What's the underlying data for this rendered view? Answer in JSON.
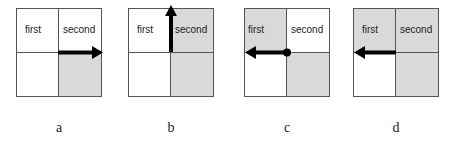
{
  "colors": {
    "shade": "#d9d9d9",
    "border": "#555555",
    "arrow": "#000000"
  },
  "panels": [
    {
      "caption": "a",
      "cells": {
        "first": "first",
        "second": "second"
      },
      "shaded": [
        "br"
      ],
      "arrow": "right-along-middle-from-center"
    },
    {
      "caption": "b",
      "cells": {
        "first": "first",
        "second": "second"
      },
      "shaded": [
        "tr",
        "br"
      ],
      "arrow": "up-along-center-line"
    },
    {
      "caption": "c",
      "cells": {
        "first": "first",
        "second": "second"
      },
      "shaded": [
        "tl",
        "br"
      ],
      "arrow": "left-along-middle-from-center-with-dot"
    },
    {
      "caption": "d",
      "cells": {
        "first": "first",
        "second": "second"
      },
      "shaded": [
        "tl",
        "tr",
        "br"
      ],
      "arrow": "left-along-middle-from-center"
    }
  ]
}
